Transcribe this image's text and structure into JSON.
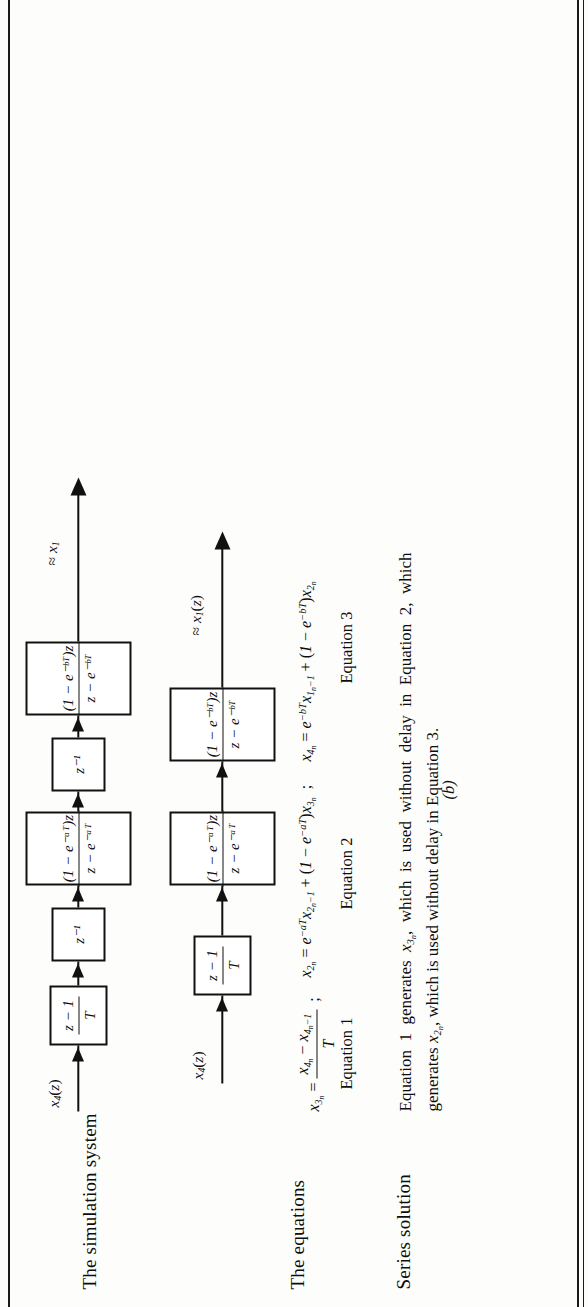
{
  "figure": {
    "orientation": "rotated-90-ccw",
    "row_labels": [
      {
        "id": "simulation-system",
        "text": "The simulation system"
      },
      {
        "id": "equations",
        "text": "The equations"
      },
      {
        "id": "series-solution",
        "text": "Series solution"
      }
    ],
    "subfigure_labels": [
      {
        "id": "a",
        "text": "(a)"
      },
      {
        "id": "b",
        "text": "(b)"
      }
    ]
  },
  "diagram_a": {
    "input_label": {
      "x": "x",
      "sub": "4",
      "arg": "(z)"
    },
    "output_label": {
      "approx": "≈",
      "x": "x",
      "sub": "1",
      "arg": ""
    },
    "blocks": [
      {
        "id": "differencer-a",
        "kind": "fraction",
        "num": "z − 1",
        "den": "T"
      },
      {
        "id": "delay-1-a",
        "kind": "plain",
        "text": "z⁻¹"
      },
      {
        "id": "lag-a-a",
        "kind": "fraction",
        "num": "(1 − e⁻ᵃᵀ)z",
        "den": "z − e⁻ᵃᵀ"
      },
      {
        "id": "delay-2-a",
        "kind": "plain",
        "text": "z⁻¹"
      },
      {
        "id": "lag-b-a",
        "kind": "fraction",
        "num": "(1 − e⁻ᵇᵀ)z",
        "den": "z − e⁻ᵇᵀ"
      }
    ]
  },
  "diagram_b": {
    "input_label": {
      "x": "x",
      "sub": "4",
      "arg": "(z)"
    },
    "output_label": {
      "approx": "≈",
      "x": "x",
      "sub": "1",
      "arg": "(z)"
    },
    "blocks": [
      {
        "id": "differencer-b",
        "kind": "fraction",
        "num": "z − 1",
        "den": "T"
      },
      {
        "id": "lag-a-b",
        "kind": "fraction",
        "num": "(1 − e⁻ᵃᵀ)z",
        "den": "z − e⁻ᵃᵀ"
      },
      {
        "id": "lag-b-b",
        "kind": "fraction",
        "num": "(1 − e⁻ᵇᵀ)z",
        "den": "z − e⁻ᵇᵀ"
      }
    ]
  },
  "equations": [
    {
      "id": "equation-1",
      "tag": "Equation 1",
      "lhs": "x₃ₙ",
      "rhs_plain": "(x₄ₙ − x₄ₙ₋₁) / T",
      "text": "x₃ₙ = (x₄ₙ − x₄ₙ₋₁)/T"
    },
    {
      "id": "equation-2",
      "tag": "Equation 2",
      "lhs": "x₂ₙ",
      "rhs_plain": "e⁻ᵃᵀ x₂ₙ₋₁ + (1 − e⁻ᵃᵀ) x₃ₙ",
      "text": "x₂ₙ = e⁻ᵃᵀx₂ₙ₋₁ + (1 − e⁻ᵃᵀ)x₃ₙ"
    },
    {
      "id": "equation-3",
      "tag": "Equation 3",
      "lhs": "x₄ₙ",
      "rhs_plain": "e⁻ᵇᵀ x₁ₙ₋₁ + (1 − e⁻ᵇᵀ) x₂ₙ",
      "text": "x₄ₙ = e⁻ᵇᵀx₁ₙ₋₁ + (1 − e⁻ᵇᵀ)x₂ₙ"
    }
  ],
  "caption": {
    "line1": "Equation 1 generates x₃ₙ, which is used without delay in Equation 2, which",
    "line2": "generates x₂ₙ, which is used without delay in Equation 3.",
    "full": "Equation 1 generates x3n, which is used without delay in Equation 2, which generates x2n, which is used without delay in Equation 3."
  },
  "colors": {
    "ink": "#111111",
    "paper": "#fdfdfb"
  }
}
